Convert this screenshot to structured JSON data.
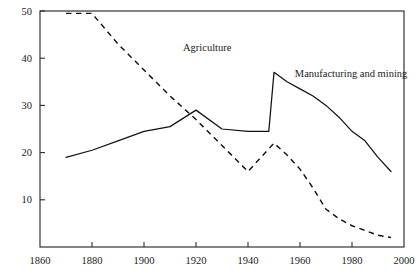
{
  "chart_data": {
    "type": "line",
    "title": "",
    "subtitle": "",
    "xlabel": "",
    "ylabel": "",
    "xlim": [
      1860,
      2000
    ],
    "ylim": [
      0,
      50
    ],
    "xticks": [
      1860,
      1880,
      1900,
      1920,
      1940,
      1960,
      1980,
      2000
    ],
    "xtick_labels": [
      "1860",
      "1880",
      "1900",
      "1920",
      "1940",
      "1960",
      "1980",
      "2000"
    ],
    "yticks": [
      10,
      20,
      30,
      40,
      50
    ],
    "ytick_labels": [
      "10",
      "20",
      "30",
      "40",
      "50"
    ],
    "grid": false,
    "legend_position": "inline-annotation",
    "series": [
      {
        "name": "Agriculture",
        "style": "dashed",
        "label_x": 1915,
        "label_y": 41.5,
        "x": [
          1870,
          1880,
          1890,
          1900,
          1910,
          1920,
          1930,
          1940,
          1945,
          1950,
          1955,
          1960,
          1965,
          1970,
          1975,
          1980,
          1985,
          1990,
          1995
        ],
        "values": [
          49.5,
          49.5,
          43.0,
          37.5,
          32.0,
          27.0,
          21.5,
          16.0,
          19.0,
          22.0,
          19.5,
          16.5,
          12.5,
          8.0,
          6.0,
          4.5,
          3.5,
          2.5,
          2.0
        ]
      },
      {
        "name": "Manufacturing and mining",
        "style": "solid",
        "label_x": 1958,
        "label_y": 36.0,
        "x": [
          1870,
          1880,
          1890,
          1900,
          1910,
          1920,
          1930,
          1940,
          1948,
          1950,
          1955,
          1960,
          1965,
          1970,
          1975,
          1980,
          1985,
          1990,
          1995
        ],
        "values": [
          19.0,
          20.5,
          22.5,
          24.5,
          25.5,
          29.0,
          25.0,
          24.5,
          24.5,
          37.0,
          35.0,
          33.5,
          32.0,
          30.0,
          27.5,
          24.5,
          22.5,
          19.0,
          16.0
        ]
      }
    ]
  },
  "axes": {
    "x_axis_name": "year-axis",
    "y_axis_name": "percent-axis"
  }
}
